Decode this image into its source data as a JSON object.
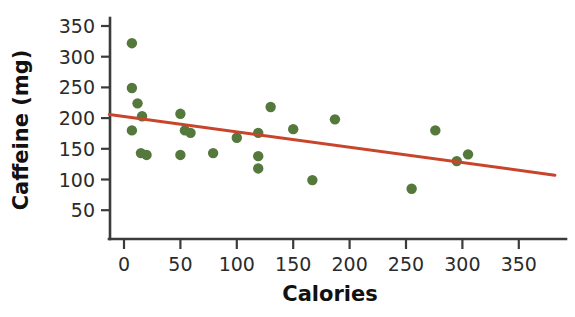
{
  "chart_data": {
    "type": "scatter",
    "title": "",
    "xlabel": "Calories",
    "ylabel": "Caffeine (mg)",
    "xlim": [
      -15,
      385
    ],
    "ylim": [
      25,
      365
    ],
    "xticks": [
      0,
      50,
      100,
      150,
      200,
      250,
      300,
      350
    ],
    "xticklabels": [
      "0",
      "50",
      "100",
      "150",
      "200",
      "250",
      "300",
      "350"
    ],
    "yticks": [
      50,
      100,
      150,
      200,
      250,
      300,
      350
    ],
    "yticklabels": [
      "50",
      "100",
      "150",
      "200",
      "250",
      "300",
      "350"
    ],
    "grid": false,
    "legend": "none",
    "point_color": "#55783c",
    "point_radius": 5.2,
    "trend_color": "#c8452c",
    "trend_width": 3.0,
    "axis_color": "#3b3b3b",
    "background": "#ffffff",
    "points": [
      {
        "x": 7,
        "y": 322
      },
      {
        "x": 7,
        "y": 249
      },
      {
        "x": 12,
        "y": 224
      },
      {
        "x": 16,
        "y": 203
      },
      {
        "x": 7,
        "y": 180
      },
      {
        "x": 15,
        "y": 143
      },
      {
        "x": 20,
        "y": 140
      },
      {
        "x": 50,
        "y": 207
      },
      {
        "x": 50,
        "y": 140
      },
      {
        "x": 54,
        "y": 180
      },
      {
        "x": 59,
        "y": 176
      },
      {
        "x": 79,
        "y": 143
      },
      {
        "x": 100,
        "y": 168
      },
      {
        "x": 119,
        "y": 176
      },
      {
        "x": 119,
        "y": 138
      },
      {
        "x": 119,
        "y": 118
      },
      {
        "x": 130,
        "y": 218
      },
      {
        "x": 150,
        "y": 182
      },
      {
        "x": 167,
        "y": 99
      },
      {
        "x": 187,
        "y": 198
      },
      {
        "x": 255,
        "y": 85
      },
      {
        "x": 276,
        "y": 180
      },
      {
        "x": 295,
        "y": 130
      },
      {
        "x": 305,
        "y": 141
      }
    ],
    "trend": {
      "x0": -13,
      "y0": 206,
      "x1": 382,
      "y1": 107
    }
  }
}
